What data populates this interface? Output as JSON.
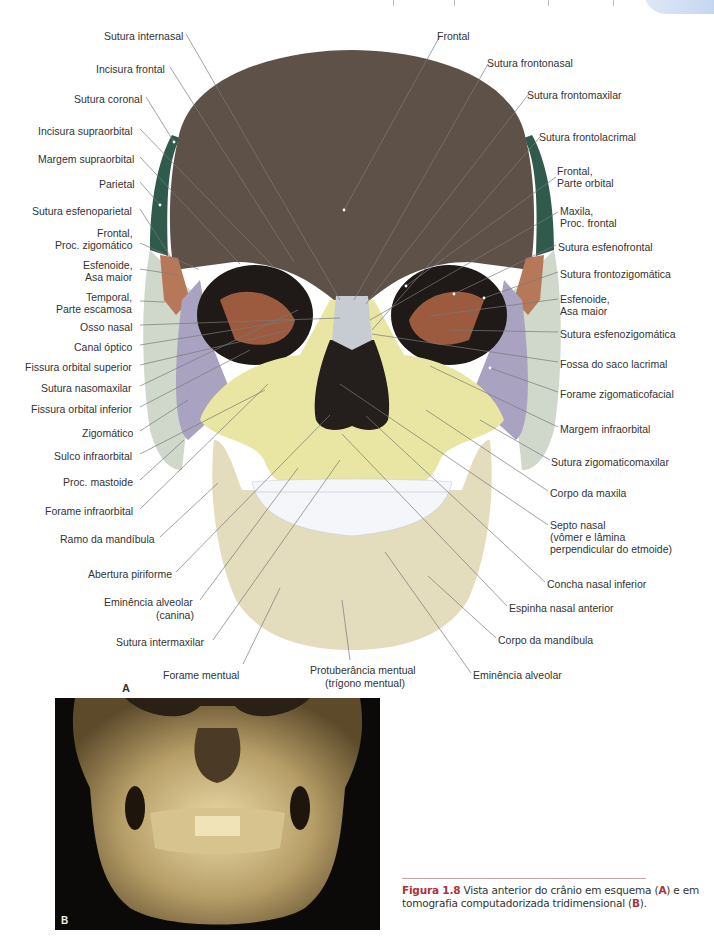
{
  "figure": {
    "panel_a_letter": "A",
    "panel_b_letter": "B",
    "labels_left": [
      {
        "text": "Sutura internasal",
        "x": 104,
        "y": 30
      },
      {
        "text": "Incisura frontal",
        "x": 96,
        "y": 63
      },
      {
        "text": "Sutura coronal",
        "x": 74,
        "y": 93
      },
      {
        "text": "Incisura supraorbital",
        "x": 38,
        "y": 125
      },
      {
        "text": "Margem supraorbital",
        "x": 38,
        "y": 153
      },
      {
        "text": "Parietal",
        "x": 99,
        "y": 178
      },
      {
        "text": "Sutura esfenoparietal",
        "x": 32,
        "y": 205
      },
      {
        "text": "Frontal,",
        "x": 97,
        "y": 227
      },
      {
        "text": "Proc. zigomático",
        "x": 55,
        "y": 239
      },
      {
        "text": "Esfenoide,",
        "x": 83,
        "y": 259
      },
      {
        "text": "Asa maior",
        "x": 85,
        "y": 271
      },
      {
        "text": "Temporal,",
        "x": 86,
        "y": 291
      },
      {
        "text": "Parte escamosa",
        "x": 56,
        "y": 303
      },
      {
        "text": "Osso nasal",
        "x": 80,
        "y": 321
      },
      {
        "text": "Canal óptico",
        "x": 74,
        "y": 341
      },
      {
        "text": "Fissura orbital superior",
        "x": 25,
        "y": 361
      },
      {
        "text": "Sutura nasomaxilar",
        "x": 41,
        "y": 382
      },
      {
        "text": "Fissura orbital inferior",
        "x": 31,
        "y": 403
      },
      {
        "text": "Zigomático",
        "x": 82,
        "y": 427
      },
      {
        "text": "Sulco infraorbital",
        "x": 54,
        "y": 450
      },
      {
        "text": "Proc. mastoide",
        "x": 63,
        "y": 476
      },
      {
        "text": "Forame infraorbital",
        "x": 45,
        "y": 505
      },
      {
        "text": "Ramo da mandíbula",
        "x": 60,
        "y": 533
      },
      {
        "text": "Abertura piriforme",
        "x": 88,
        "y": 568
      },
      {
        "text": "Eminência alveolar",
        "x": 104,
        "y": 596
      },
      {
        "text": "(canina)",
        "x": 156,
        "y": 609
      },
      {
        "text": "Sutura intermaxilar",
        "x": 116,
        "y": 636
      },
      {
        "text": "Forame mentual",
        "x": 163,
        "y": 669
      }
    ],
    "labels_right": [
      {
        "text": "Frontal",
        "x": 437,
        "y": 30
      },
      {
        "text": "Sutura frontonasal",
        "x": 487,
        "y": 57
      },
      {
        "text": "Sutura frontomaxilar",
        "x": 527,
        "y": 89
      },
      {
        "text": "Sutura frontolacrimal",
        "x": 539,
        "y": 131
      },
      {
        "text": "Frontal,",
        "x": 557,
        "y": 165
      },
      {
        "text": "Parte orbital",
        "x": 557,
        "y": 177
      },
      {
        "text": "Maxila,",
        "x": 560,
        "y": 205
      },
      {
        "text": "Proc. frontal",
        "x": 560,
        "y": 217
      },
      {
        "text": "Sutura esfenofrontal",
        "x": 558,
        "y": 241
      },
      {
        "text": "Sutura frontozigomática",
        "x": 560,
        "y": 268
      },
      {
        "text": "Esfenoide,",
        "x": 560,
        "y": 293
      },
      {
        "text": "Asa maior",
        "x": 560,
        "y": 305
      },
      {
        "text": "Sutura esfenozigomática",
        "x": 560,
        "y": 328
      },
      {
        "text": "Fossa do saco lacrimal",
        "x": 560,
        "y": 358
      },
      {
        "text": "Forame zigomaticofacial",
        "x": 560,
        "y": 388
      },
      {
        "text": "Margem infraorbital",
        "x": 560,
        "y": 423
      },
      {
        "text": "Sutura zigomaticomaxilar",
        "x": 551,
        "y": 456
      },
      {
        "text": "Corpo da maxila",
        "x": 550,
        "y": 487
      },
      {
        "text": "Septo nasal",
        "x": 550,
        "y": 519
      },
      {
        "text": "(vômer e lâmina",
        "x": 550,
        "y": 531
      },
      {
        "text": "perpendicular do etmoide)",
        "x": 550,
        "y": 543
      },
      {
        "text": "Concha nasal inferior",
        "x": 547,
        "y": 578
      },
      {
        "text": "Espinha nasal anterior",
        "x": 509,
        "y": 602
      },
      {
        "text": "Corpo da mandíbula",
        "x": 498,
        "y": 634
      },
      {
        "text": "Eminência alveolar",
        "x": 473,
        "y": 669
      }
    ],
    "labels_bottom": [
      {
        "text": "Protuberância mentual",
        "x": 310,
        "y": 664
      },
      {
        "text": "(trígono mentual)",
        "x": 325,
        "y": 677
      }
    ],
    "colors": {
      "frontal": "#5e5248",
      "parietal": "#2f5a4c",
      "sphenoid": "#b7785a",
      "temporal": "#cfd8cb",
      "zygomatic": "#a9a3c1",
      "maxilla": "#e8e6a2",
      "mandible": "#e3dcbd",
      "nasal": "#c7ccd3",
      "teeth": "#f4f6fa",
      "orbit": "#1f1a18",
      "leader_line": "#7a7a7a"
    }
  },
  "caption": {
    "fig_number": "Figura 1.8",
    "text_part1": " Vista anterior do crânio em esquema (",
    "letter_a": "A",
    "text_part2": ") e em tomografia computadorizada tridimensional (",
    "letter_b": "B",
    "text_part3": ")."
  }
}
